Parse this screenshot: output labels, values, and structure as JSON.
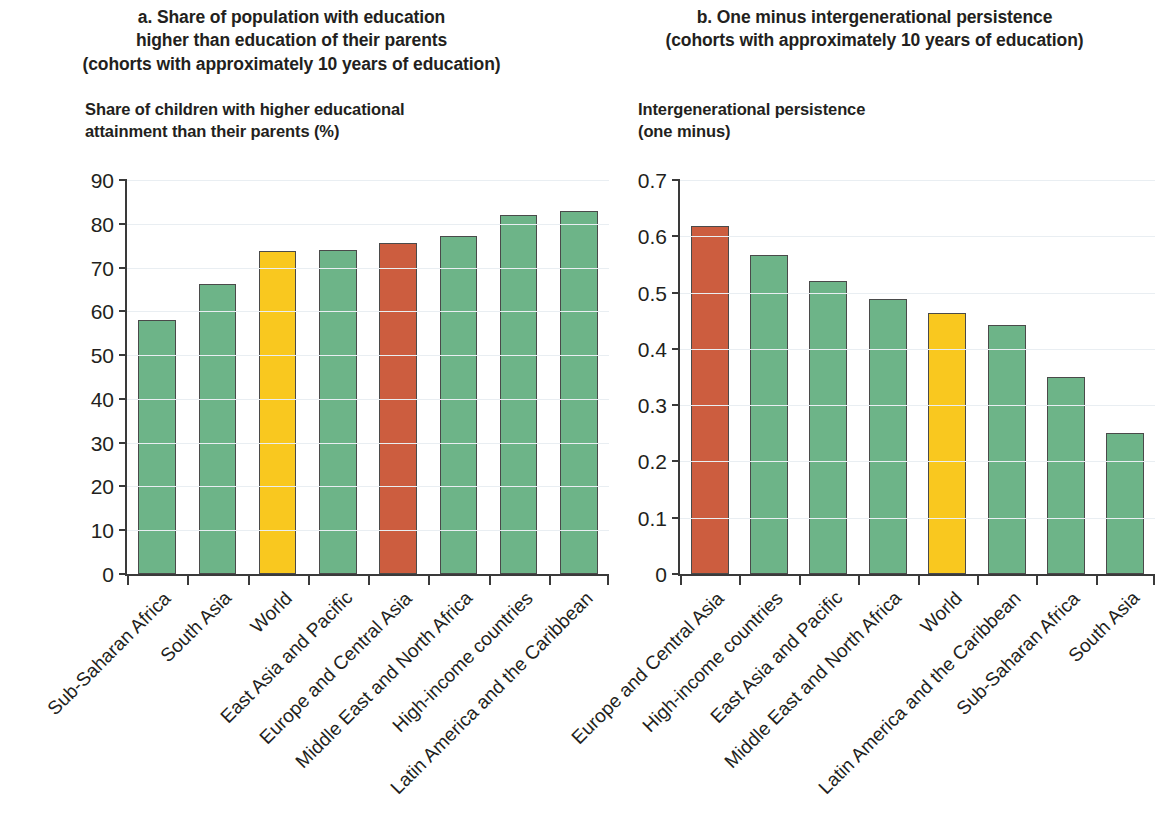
{
  "colors": {
    "green": "#6DB488",
    "yellow": "#F9C81F",
    "red": "#CC5D3F",
    "axis": "#3a3a3a",
    "grid": "#e9eef2",
    "text": "#231f20"
  },
  "panel_a": {
    "title_line1": "a. Share of population with education",
    "title_line2": "higher than education of their parents",
    "title_line3": "(cohorts with approximately 10 years of education)",
    "axis_title_line1": "Share of children with higher educational",
    "axis_title_line2": "attainment than their parents (%)"
  },
  "panel_b": {
    "title_line1": "b. One minus intergenerational persistence",
    "title_line2": "(cohorts with approximately 10 years of education)",
    "axis_title_line1": "Intergenerational persistence",
    "axis_title_line2": "(one minus)"
  },
  "chart_data": [
    {
      "type": "bar",
      "panel": "a",
      "title": "a. Share of population with education higher than education of their parents (cohorts with approximately 10 years of education)",
      "xlabel": "",
      "ylabel": "Share of children with higher educational attainment than their parents (%)",
      "ylim": [
        0,
        90
      ],
      "ytick_values": [
        0,
        10,
        20,
        30,
        40,
        50,
        60,
        70,
        80,
        90
      ],
      "ytick_labels": [
        "0",
        "10",
        "20",
        "30",
        "40",
        "50",
        "60",
        "70",
        "80",
        "90"
      ],
      "grid": true,
      "legend": "none",
      "categories": [
        "Sub-Saharan Africa",
        "South Asia",
        "World",
        "East Asia and Pacific",
        "Europe and Central Asia",
        "Middle East and North Africa",
        "High-income countries",
        "Latin America and the Caribbean"
      ],
      "values": [
        58.0,
        66.2,
        73.7,
        73.9,
        75.5,
        77.3,
        82.0,
        82.9
      ],
      "bar_colors": [
        "green",
        "green",
        "yellow",
        "green",
        "red",
        "green",
        "green",
        "green"
      ]
    },
    {
      "type": "bar",
      "panel": "b",
      "title": "b. One minus intergenerational persistence (cohorts with approximately 10 years of education)",
      "xlabel": "",
      "ylabel": "Intergenerational persistence (one minus)",
      "ylim": [
        0,
        0.7
      ],
      "ytick_values": [
        0,
        0.1,
        0.2,
        0.3,
        0.4,
        0.5,
        0.6,
        0.7
      ],
      "ytick_labels": [
        "0",
        "0.1",
        "0.2",
        "0.3",
        "0.4",
        "0.5",
        "0.6",
        "0.7"
      ],
      "grid": true,
      "legend": "none",
      "categories": [
        "Europe and Central Asia",
        "High-income countries",
        "East Asia and Pacific",
        "Middle East and North Africa",
        "World",
        "Latin America and the Caribbean",
        "Sub-Saharan Africa",
        "South Asia"
      ],
      "values": [
        0.619,
        0.566,
        0.52,
        0.489,
        0.463,
        0.442,
        0.35,
        0.251
      ],
      "bar_colors": [
        "red",
        "green",
        "green",
        "green",
        "yellow",
        "green",
        "green",
        "green"
      ]
    }
  ]
}
